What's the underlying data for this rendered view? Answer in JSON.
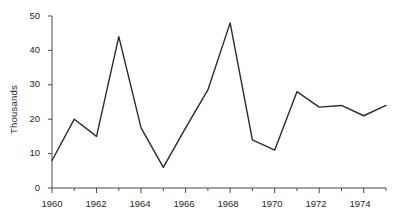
{
  "chart_data": {
    "type": "line",
    "title": "",
    "subtitle": "",
    "xlabel": "",
    "ylabel": "Thousands",
    "x": [
      1960,
      1961,
      1962,
      1963,
      1964,
      1965,
      1966,
      1967,
      1968,
      1969,
      1970,
      1971,
      1972,
      1973,
      1974,
      1975
    ],
    "values": [
      8,
      20,
      15,
      44,
      17.5,
      6,
      17.5,
      28.5,
      48,
      14,
      11,
      28,
      23.5,
      24,
      21,
      24
    ],
    "series": [
      {
        "name": "",
        "values": [
          8,
          20,
          15,
          44,
          17.5,
          6,
          17.5,
          28.5,
          48,
          14,
          11,
          28,
          23.5,
          24,
          21,
          24
        ]
      }
    ],
    "xlim": [
      1960,
      1975
    ],
    "ylim": [
      0,
      50
    ],
    "y_ticks": [
      0,
      10,
      20,
      30,
      40,
      50
    ],
    "y_tick_labels": [
      "0",
      "10",
      "20",
      "30",
      "40",
      "50"
    ],
    "x_ticks": [
      1960,
      1961,
      1962,
      1963,
      1964,
      1965,
      1966,
      1967,
      1968,
      1969,
      1970,
      1971,
      1972,
      1973,
      1974,
      1975
    ],
    "x_tick_labels_major": [
      "1960",
      "1962",
      "1964",
      "1966",
      "1968",
      "1970",
      "1972",
      "1974"
    ],
    "x_major_ticks": [
      1960,
      1962,
      1964,
      1966,
      1968,
      1970,
      1972,
      1974
    ],
    "grid": false,
    "legend": null,
    "annotations": [],
    "line_color": "#2b2b2b",
    "axis_color": "#4a4a4a",
    "background_color": "#ffffff"
  },
  "axes": {
    "y_axis_title": "Thousands",
    "y_labels": {
      "t0": "0",
      "t1": "10",
      "t2": "20",
      "t3": "30",
      "t4": "40",
      "t5": "50"
    },
    "x_labels": {
      "t1960": "1960",
      "t1962": "1962",
      "t1964": "1964",
      "t1966": "1966",
      "t1968": "1968",
      "t1970": "1970",
      "t1972": "1972",
      "t1974": "1974"
    }
  }
}
